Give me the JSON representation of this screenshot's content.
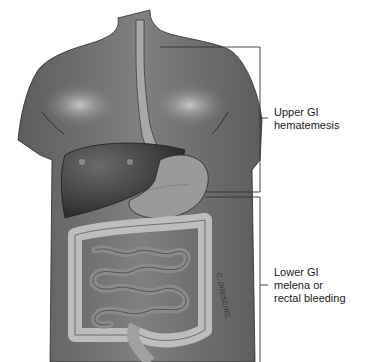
{
  "figure": {
    "labels": {
      "upper": {
        "title": "Upper GI",
        "description": "hematemesis"
      },
      "lower": {
        "title": "Lower GI",
        "line1": "melena or",
        "line2": "rectal bleeding"
      }
    },
    "signature": "C. DRESCHEL",
    "colors": {
      "skin": "#7a7a7a",
      "skin_highlight": "#b5b5b5",
      "liver": "#3e3e3e",
      "stomach": "#9a9a9a",
      "intestine": "#8c8c8c",
      "colon": "#b0b0b0",
      "leader_line": "#333333"
    }
  }
}
